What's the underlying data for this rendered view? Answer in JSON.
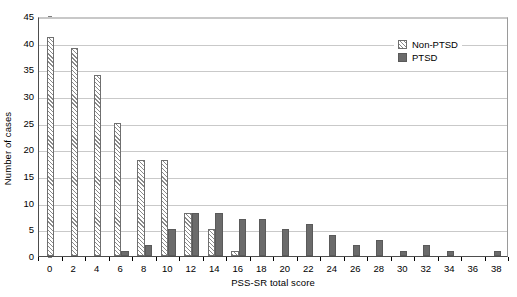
{
  "chart_data": {
    "type": "bar",
    "title": "",
    "xlabel": "PSS-SR total score",
    "ylabel": "Number of cases",
    "categories": [
      "0",
      "2",
      "4",
      "6",
      "8",
      "10",
      "12",
      "14",
      "16",
      "18",
      "20",
      "22",
      "24",
      "26",
      "28",
      "30",
      "32",
      "34",
      "36",
      "38"
    ],
    "series": [
      {
        "name": "Non-PTSD",
        "values": [
          41,
          39,
          34,
          25,
          18,
          18,
          8,
          5,
          1,
          0,
          0,
          0,
          0,
          0,
          0,
          0,
          0,
          0,
          0,
          0
        ]
      },
      {
        "name": "PTSD",
        "values": [
          0,
          0,
          0,
          1,
          2,
          5,
          8,
          8,
          7,
          7,
          5,
          6,
          4,
          2,
          3,
          1,
          2,
          1,
          0,
          1
        ]
      }
    ],
    "ylim": [
      0,
      45
    ],
    "y_ticks": [
      "0",
      "5",
      "10",
      "15",
      "20",
      "25",
      "30",
      "35",
      "40",
      "45"
    ],
    "grid": "horizontal",
    "legend_position": "top-right"
  },
  "legend": {
    "entries": [
      {
        "label": "Non-PTSD",
        "swatch": "hatched-diagonal-swatch"
      },
      {
        "label": "PTSD",
        "swatch": "solid-gray-swatch"
      }
    ]
  },
  "colors": {
    "ptsd_fill": "#6b6b6b",
    "non_ptsd_hatch": "#8a8a8a",
    "non_ptsd_fill": "#ffffff",
    "gridline": "#c9c9c9",
    "axis": "#4d4d4d",
    "text": "#000000"
  }
}
